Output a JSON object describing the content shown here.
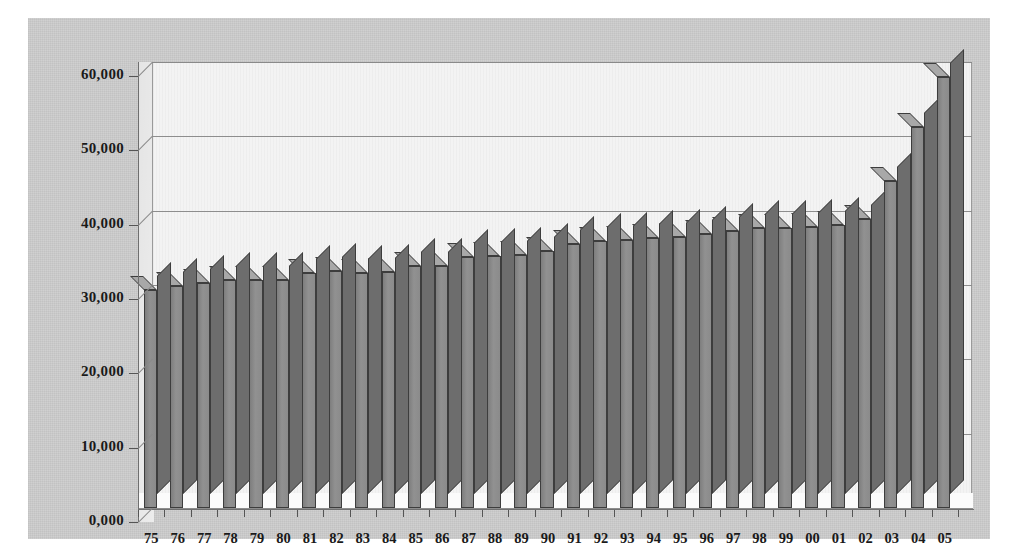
{
  "chart_data": {
    "type": "bar",
    "title": "",
    "subtitle": "",
    "xlabel": "",
    "ylabel": "",
    "ylim": [
      0,
      60000
    ],
    "ytick_values": [
      0,
      10000,
      20000,
      30000,
      40000,
      50000,
      60000
    ],
    "ytick_labels": [
      "0,000",
      "10,000",
      "20,000",
      "30,000",
      "40,000",
      "50,000",
      "60,000"
    ],
    "grid": true,
    "legend": "none",
    "style": "3d-column",
    "categories": [
      "75",
      "76",
      "77",
      "78",
      "79",
      "80",
      "81",
      "82",
      "83",
      "84",
      "85",
      "86",
      "87",
      "88",
      "89",
      "90",
      "91",
      "92",
      "93",
      "94",
      "95",
      "96",
      "97",
      "98",
      "99",
      "00",
      "01",
      "02",
      "03",
      "04",
      "05"
    ],
    "values": [
      31200,
      31800,
      32100,
      32600,
      32500,
      32500,
      33500,
      33800,
      33500,
      33600,
      34400,
      34500,
      35700,
      35800,
      35900,
      36500,
      37400,
      37800,
      38000,
      38200,
      38300,
      38700,
      39100,
      39500,
      39600,
      39700,
      40000,
      40800,
      45900,
      53100,
      59800
    ]
  },
  "colors": {
    "panel_background": "#c9c9c9",
    "plot_background": "#f3f3f3",
    "bar_fill": "#8a8a8a",
    "bar_edge": "#3d3d3d",
    "bar_top": "#a8a8a8",
    "bar_side": "#6d6d6d",
    "gridline": "#8d8d8d",
    "axis_line": "#6f6f6f",
    "text": "#1a1a1a"
  },
  "axes": {
    "y_axis_name": "value-axis",
    "x_axis_name": "category-axis"
  }
}
